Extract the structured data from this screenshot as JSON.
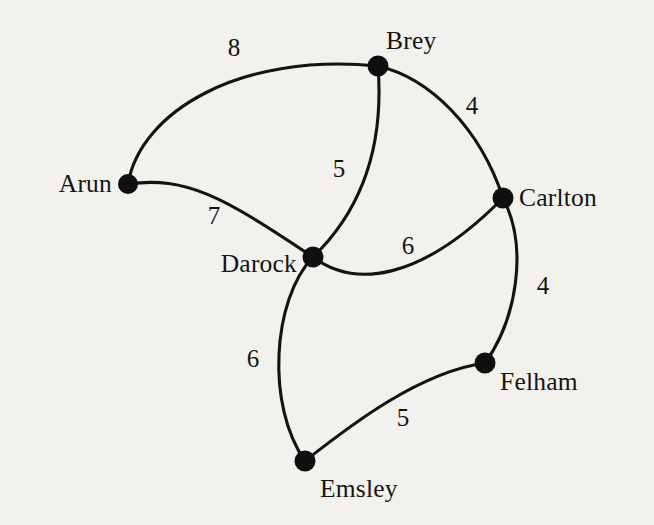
{
  "diagram": {
    "type": "weighted-undirected-graph",
    "title": "",
    "background_color": "#f2f1ed",
    "ink_color": "#131313",
    "canvas": {
      "width": 654,
      "height": 525
    }
  },
  "nodes": [
    {
      "id": "arun",
      "label": "Arun",
      "x": 128,
      "y": 184,
      "r": 10.0,
      "label_x": 112,
      "label_y": 184,
      "label_anchor": "right"
    },
    {
      "id": "brey",
      "label": "Brey",
      "x": 378,
      "y": 66,
      "r": 10.5,
      "label_x": 386,
      "label_y": 41,
      "label_anchor": "left"
    },
    {
      "id": "carlton",
      "label": "Carlton",
      "x": 503,
      "y": 198,
      "r": 10.5,
      "label_x": 519,
      "label_y": 198,
      "label_anchor": "left"
    },
    {
      "id": "darock",
      "label": "Darock",
      "x": 313,
      "y": 257,
      "r": 10.5,
      "label_x": 297,
      "label_y": 264,
      "label_anchor": "right"
    },
    {
      "id": "felham",
      "label": "Felham",
      "x": 485,
      "y": 363,
      "r": 10.5,
      "label_x": 500,
      "label_y": 382,
      "label_anchor": "left"
    },
    {
      "id": "emsley",
      "label": "Emsley",
      "x": 305,
      "y": 461,
      "r": 10.5,
      "label_x": 320,
      "label_y": 489,
      "label_anchor": "left"
    }
  ],
  "edges": [
    {
      "id": "arun-brey",
      "from": "arun",
      "to": "brey",
      "weight": "8",
      "weight_value": 8,
      "label_x": 234,
      "label_y": 47,
      "path": "M 128 184 C 140 112 240 52 378 66"
    },
    {
      "id": "brey-carlton",
      "from": "brey",
      "to": "carlton",
      "weight": "4",
      "weight_value": 4,
      "label_x": 472,
      "label_y": 105,
      "path": "M 378 66 C 430 78 480 128 503 198"
    },
    {
      "id": "brey-darock",
      "from": "brey",
      "to": "darock",
      "weight": "5",
      "weight_value": 5,
      "label_x": 339,
      "label_y": 168,
      "path": "M 378 66 C 383 130 372 200 313 257"
    },
    {
      "id": "arun-darock",
      "from": "arun",
      "to": "darock",
      "weight": "7",
      "weight_value": 7,
      "label_x": 214,
      "label_y": 215,
      "path": "M 128 184 C 186 176 222 196 313 257"
    },
    {
      "id": "darock-carlton",
      "from": "darock",
      "to": "carlton",
      "weight": "6",
      "weight_value": 6,
      "label_x": 408,
      "label_y": 245,
      "path": "M 313 257 C 354 288 420 282 503 198"
    },
    {
      "id": "carlton-felham",
      "from": "carlton",
      "to": "felham",
      "weight": "4",
      "weight_value": 4,
      "label_x": 543,
      "label_y": 285,
      "path": "M 503 198 C 529 248 516 320 485 363"
    },
    {
      "id": "darock-emsley",
      "from": "darock",
      "to": "emsley",
      "weight": "6",
      "weight_value": 6,
      "label_x": 253,
      "label_y": 358,
      "path": "M 313 257 C 272 300 266 406 305 461"
    },
    {
      "id": "emsley-felham",
      "from": "emsley",
      "to": "felham",
      "weight": "5",
      "weight_value": 5,
      "label_x": 403,
      "label_y": 417,
      "path": "M 305 461 C 352 424 420 372 485 363"
    }
  ]
}
